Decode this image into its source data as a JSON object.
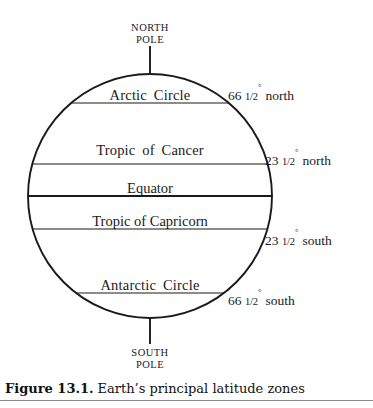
{
  "figure": {
    "caption_number": "Figure 13.1.",
    "caption_body": "Earth’s principal latitude zones",
    "background_color": "#ffffff",
    "ink_color": "#1a1a1a",
    "rule_color": "#8a8a8a"
  },
  "diagram": {
    "type": "labeled-circle-diagram",
    "globe": {
      "center_x": 150,
      "center_y": 196,
      "radius": 122
    },
    "poles": [
      {
        "name": "north-pole",
        "line1": "NORTH",
        "line2": "POLE",
        "text_x": 150,
        "text_y": 22,
        "stub_x": 150,
        "stub_y1": 46,
        "stub_y2": 74
      },
      {
        "name": "south-pole",
        "line1": "SOUTH",
        "line2": "POLE",
        "text_x": 150,
        "text_y": 347,
        "stub_x": 150,
        "stub_y1": 318,
        "stub_y2": 344
      }
    ],
    "zones": [
      {
        "id": "arctic-circle",
        "label": "Arctic  Circle",
        "label_x": 150,
        "label_y": 88,
        "line_y": 103,
        "emphasis": false,
        "latitude": {
          "degrees": "66",
          "fraction": "1/2",
          "degree_symbol": "°",
          "direction": "north",
          "x": 228,
          "y": 87
        }
      },
      {
        "id": "tropic-of-cancer",
        "label": "Tropic  of  Cancer",
        "label_x": 150,
        "label_y": 143,
        "line_y": 164,
        "emphasis": false,
        "latitude": {
          "degrees": "23",
          "fraction": "1/2",
          "degree_symbol": "°",
          "direction": "north",
          "x": 265,
          "y": 152,
          "x_offset": 0
        }
      },
      {
        "id": "equator",
        "label": "Equator",
        "label_x": 150,
        "label_y": 181,
        "line_y": 196,
        "emphasis": true,
        "latitude": null
      },
      {
        "id": "tropic-of-capricorn",
        "label": "Tropic of Capricorn",
        "label_x": 150,
        "label_y": 214,
        "line_y": 229,
        "emphasis": false,
        "latitude": {
          "degrees": "23",
          "fraction": "1/2",
          "degree_symbol": "°",
          "direction": "south",
          "x": 265,
          "y": 232
        }
      },
      {
        "id": "antarctic-circle",
        "label": "Antarctic  Circle",
        "label_x": 150,
        "label_y": 278,
        "line_y": 293,
        "emphasis": false,
        "latitude": {
          "degrees": "66",
          "fraction": "1/2",
          "degree_symbol": "°",
          "direction": "south",
          "x": 228,
          "y": 292
        }
      }
    ]
  }
}
